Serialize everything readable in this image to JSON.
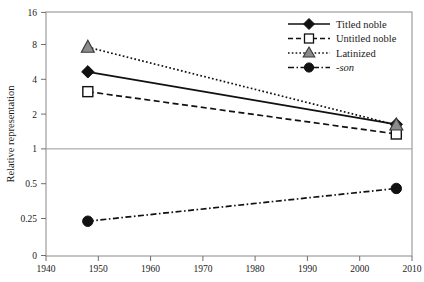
{
  "chart_data": {
    "type": "line",
    "title": "",
    "subtitle": "",
    "xlabel": "",
    "ylabel": "Relative representation",
    "xlim": [
      1940,
      2010
    ],
    "ylim_log": [
      0.125,
      16
    ],
    "yscale": "log2",
    "grid": false,
    "reference_line": {
      "value": 1,
      "label": "1"
    },
    "legend_position": "top-right",
    "x": [
      1948,
      2007
    ],
    "xticks": [
      "1940",
      "1950",
      "1960",
      "1970",
      "1980",
      "1990",
      "2000",
      "2010"
    ],
    "xtick_values": [
      1940,
      1950,
      1960,
      1970,
      1980,
      1990,
      2000,
      2010
    ],
    "yticks": [
      "16",
      "8",
      "4",
      "2",
      "1",
      "0.5",
      "0.25",
      "0"
    ],
    "ytick_values": [
      16,
      8,
      4,
      2,
      1,
      0.5,
      0.25,
      0
    ],
    "series": [
      {
        "name": "Titled noble",
        "values": [
          4.9,
          1.72
        ],
        "marker": "filled-diamond",
        "line": "solid",
        "color": "#111111"
      },
      {
        "name": "Untitled noble",
        "values": [
          3.3,
          1.42
        ],
        "marker": "open-square",
        "line": "dashed",
        "color": "#111111"
      },
      {
        "name": "Latinized",
        "values": [
          8.0,
          1.7
        ],
        "marker": "gray-triangle",
        "line": "dotted",
        "color": "#111111",
        "marker_fill": "#8c8c8c"
      },
      {
        "name": "-son",
        "values": [
          0.25,
          0.48
        ],
        "marker": "filled-circle",
        "line": "dash-dot",
        "color": "#111111",
        "italic_label": true
      }
    ]
  },
  "axes": {
    "y_title": "Relative representation",
    "y_tick_0": "16",
    "y_tick_1": "8",
    "y_tick_2": "4",
    "y_tick_3": "2",
    "y_tick_4": "1",
    "y_tick_5": "0.5",
    "y_tick_6": "0.25",
    "y_tick_7": "0",
    "x_tick_0": "1940",
    "x_tick_1": "1950",
    "x_tick_2": "1960",
    "x_tick_3": "1970",
    "x_tick_4": "1980",
    "x_tick_5": "1990",
    "x_tick_6": "2000",
    "x_tick_7": "2010"
  },
  "legend": {
    "item_0": "Titled noble",
    "item_1": "Untitled noble",
    "item_2": "Latinized",
    "item_3": "-son"
  },
  "colors": {
    "line": "#111111",
    "triangle_fill": "#8c8c8c",
    "frame": "#8a8a8a",
    "reference_line": "#9a9a9a",
    "background": "#ffffff"
  }
}
